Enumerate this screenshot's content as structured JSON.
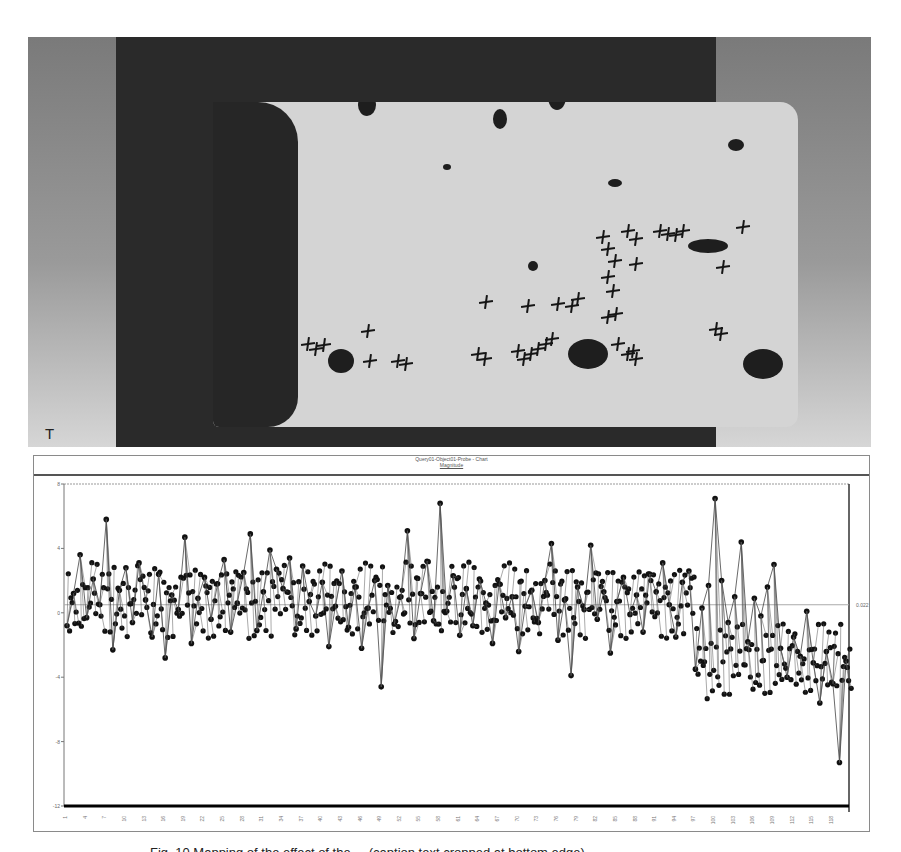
{
  "figure": {
    "scan_image": {
      "description": "grayscale inspection scan of rectangular plate with dark damage regions and cross markers",
      "scale_icon": "T",
      "markers": [
        [
          220,
          345
        ],
        [
          228,
          350
        ],
        [
          236,
          346
        ],
        [
          280,
          332
        ],
        [
          282,
          362
        ],
        [
          310,
          362
        ],
        [
          318,
          365
        ],
        [
          390,
          355
        ],
        [
          397,
          360
        ],
        [
          398,
          303
        ],
        [
          430,
          352
        ],
        [
          436,
          360
        ],
        [
          443,
          355
        ],
        [
          450,
          350
        ],
        [
          458,
          345
        ],
        [
          464,
          340
        ],
        [
          440,
          307
        ],
        [
          470,
          305
        ],
        [
          484,
          307
        ],
        [
          490,
          300
        ],
        [
          515,
          238
        ],
        [
          520,
          250
        ],
        [
          527,
          262
        ],
        [
          520,
          278
        ],
        [
          525,
          292
        ],
        [
          520,
          318
        ],
        [
          528,
          315
        ],
        [
          540,
          232
        ],
        [
          548,
          240
        ],
        [
          548,
          265
        ],
        [
          530,
          345
        ],
        [
          540,
          355
        ],
        [
          548,
          360
        ],
        [
          545,
          352
        ],
        [
          572,
          232
        ],
        [
          580,
          235
        ],
        [
          588,
          236
        ],
        [
          595,
          232
        ],
        [
          655,
          228
        ],
        [
          635,
          268
        ],
        [
          628,
          330
        ],
        [
          633,
          335
        ]
      ],
      "blobs": [
        [
          460,
          85,
          18,
          26
        ],
        [
          405,
          110,
          14,
          20
        ],
        [
          330,
          78,
          22,
          16
        ],
        [
          270,
          95,
          18,
          22
        ],
        [
          240,
          350,
          26,
          24
        ],
        [
          440,
          262,
          10,
          10
        ],
        [
          655,
          350,
          40,
          30
        ],
        [
          480,
          340,
          40,
          30
        ],
        [
          600,
          240,
          40,
          14
        ],
        [
          640,
          140,
          16,
          12
        ],
        [
          520,
          180,
          14,
          8
        ],
        [
          355,
          165,
          8,
          6
        ]
      ]
    },
    "chart_frame_title": "Query01-Object01-Probe - Chart",
    "chart_frame_subtitle": "Magnitude",
    "reference_line_label": "0.022",
    "caption": "Fig. 10  Mapping of the effect of the ... (caption text cropped at bottom edge)"
  },
  "chart_data": {
    "type": "line",
    "title": "Query01-Object01-Probe - Chart",
    "subtitle": "Magnitude",
    "xlabel": "",
    "ylabel": "",
    "ylim": [
      -12,
      8
    ],
    "yticks": [
      8,
      4,
      0,
      -4,
      -8,
      -12
    ],
    "xtick_labels_note": "rotated sample index labels (illegible)",
    "grid": false,
    "legend": null,
    "markers": "filled circles",
    "reference_line": {
      "y": 0.5,
      "label": "0.022"
    },
    "x": [
      1,
      2,
      3,
      4,
      5,
      6,
      7,
      8,
      9,
      10,
      11,
      12,
      13,
      14,
      15,
      16,
      17,
      18,
      19,
      20,
      21,
      22,
      23,
      24,
      25,
      26,
      27,
      28,
      29,
      30,
      31,
      32,
      33,
      34,
      35,
      36,
      37,
      38,
      39,
      40,
      41,
      42,
      43,
      44,
      45,
      46,
      47,
      48,
      49,
      50,
      51,
      52,
      53,
      54,
      55,
      56,
      57,
      58,
      59,
      60,
      61,
      62,
      63,
      64,
      65,
      66,
      67,
      68,
      69,
      70,
      71,
      72,
      73,
      74,
      75,
      76,
      77,
      78,
      79,
      80,
      81,
      82,
      83,
      84,
      85,
      86,
      87,
      88,
      89,
      90,
      91,
      92,
      93,
      94,
      95,
      96,
      97,
      98,
      99,
      100,
      101,
      102,
      103,
      104,
      105,
      106,
      107,
      108,
      109,
      110,
      111,
      112,
      113,
      114,
      115,
      116,
      117,
      118,
      119,
      120
    ],
    "values": [
      -0.8,
      1.2,
      3.6,
      -0.3,
      2.1,
      0.5,
      5.8,
      -2.3,
      1.4,
      2.8,
      -0.6,
      3.1,
      0.8,
      -1.5,
      2.4,
      -2.8,
      1.1,
      0.2,
      4.7,
      -1.9,
      0.9,
      2.2,
      -0.4,
      1.8,
      3.3,
      -1.2,
      0.6,
      2.5,
      4.9,
      -1.1,
      1.3,
      3.9,
      2.7,
      1.5,
      3.4,
      -1.0,
      2.9,
      0.7,
      -0.2,
      1.9,
      -2.1,
      0.4,
      2.6,
      -0.9,
      1.6,
      -2.2,
      0.3,
      2.0,
      -4.6,
      1.7,
      -0.7,
      1.0,
      5.1,
      -1.6,
      1.2,
      3.2,
      -0.5,
      6.8,
      0.1,
      2.3,
      -1.4,
      1.5,
      -0.8,
      2.1,
      0.6,
      -1.9,
      1.8,
      -0.3,
      1.0,
      -2.4,
      0.4,
      1.4,
      -0.6,
      2.0,
      4.3,
      -1.7,
      0.8,
      -3.9,
      1.6,
      0.2,
      4.2,
      -0.4,
      1.3,
      -2.5,
      0.7,
      2.2,
      -0.1,
      1.1,
      -1.2,
      2.4,
      1.3,
      3.1,
      0.5,
      -1.5,
      1.9,
      2.6,
      -3.5,
      0.3,
      1.7,
      7.1,
      2.0,
      -0.6,
      1.0,
      4.4,
      -1.8,
      0.9,
      -0.2,
      1.6,
      3.0,
      -2.2,
      -4.0,
      -1.5,
      -2.7,
      0.1,
      -3.1,
      -5.6,
      -2.4,
      -4.4,
      -9.3,
      -3.0
    ],
    "tail_values_note": "final ~60 samples trend downward to ~-4 with minimum near -9.3",
    "annotations": [
      "0.022"
    ]
  }
}
